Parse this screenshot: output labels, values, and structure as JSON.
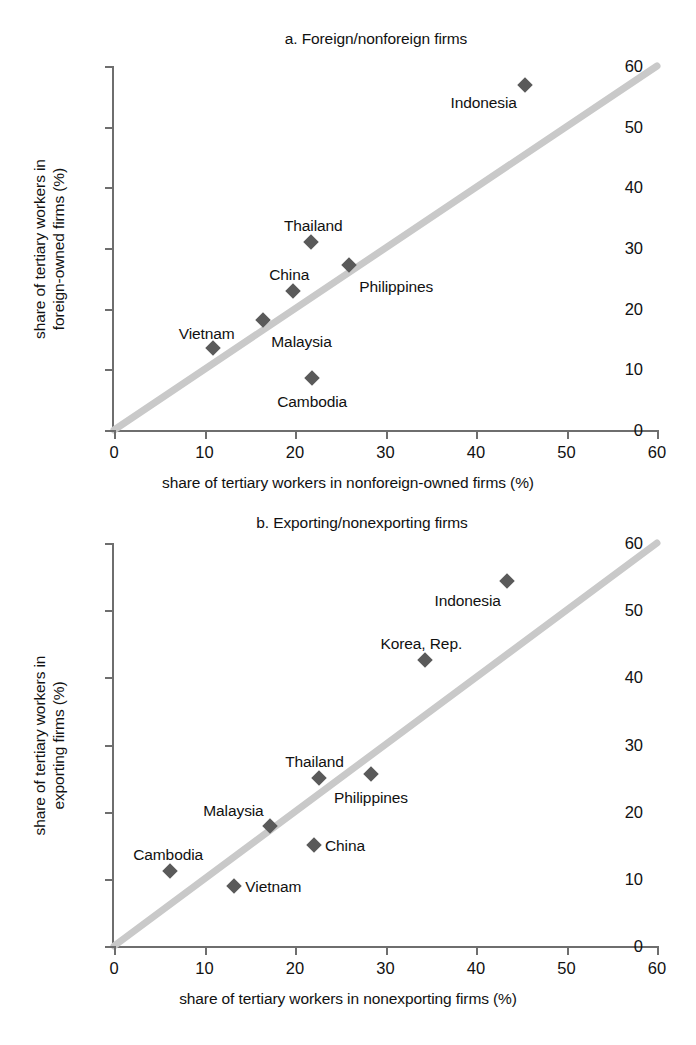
{
  "figure": {
    "background": "#ffffff",
    "marker_color": "#5a5a5a",
    "diagonal_color": "#c9c9c9",
    "axis_color": "#6e6e6e",
    "text_color": "#111111"
  },
  "chart_data": [
    {
      "type": "scatter",
      "title": "a. Foreign/nonforeign firms",
      "xlabel": "share of tertiary workers in nonforeign-owned firms (%)",
      "ylabel": "share of tertiary workers in\nforeign-owned firms (%)",
      "ylabel_line1": "share of tertiary workers in",
      "ylabel_line2": "foreign-owned firms (%)",
      "xlim": [
        0,
        60
      ],
      "ylim": [
        0,
        60
      ],
      "xticks": [
        0,
        10,
        20,
        30,
        40,
        50,
        60
      ],
      "yticks": [
        0,
        10,
        20,
        30,
        40,
        50,
        60
      ],
      "xticklabels": [
        "0",
        "10",
        "20",
        "30",
        "40",
        "50",
        "60"
      ],
      "yticklabels": [
        "0",
        "10",
        "20",
        "30",
        "40",
        "50",
        "60"
      ],
      "grid": false,
      "legend": "none",
      "reference_line": {
        "name": "45-degree line",
        "from": [
          0,
          0
        ],
        "to": [
          60,
          60
        ]
      },
      "points": [
        {
          "label": "Indonesia",
          "x": 45.4,
          "y": 56.8,
          "label_dx": -8,
          "label_dy": 18,
          "label_anchor": "end"
        },
        {
          "label": "Thailand",
          "x": 21.8,
          "y": 31.0,
          "label_dx": 2,
          "label_dy": -16,
          "label_anchor": "middle"
        },
        {
          "label": "Philippines",
          "x": 26.0,
          "y": 27.2,
          "label_dx": 10,
          "label_dy": 22,
          "label_anchor": "start"
        },
        {
          "label": "China",
          "x": 19.8,
          "y": 22.9,
          "label_dx": -4,
          "label_dy": -16,
          "label_anchor": "middle"
        },
        {
          "label": "Malaysia",
          "x": 16.5,
          "y": 18.1,
          "label_dx": 8,
          "label_dy": 22,
          "label_anchor": "start"
        },
        {
          "label": "Vietnam",
          "x": 10.9,
          "y": 13.5,
          "label_dx": -6,
          "label_dy": -14,
          "label_anchor": "middle"
        },
        {
          "label": "Cambodia",
          "x": 21.9,
          "y": 8.6,
          "label_dx": 0,
          "label_dy": 24,
          "label_anchor": "middle"
        }
      ]
    },
    {
      "type": "scatter",
      "title": "b. Exporting/nonexporting firms",
      "xlabel": "share of tertiary workers in nonexporting firms (%)",
      "ylabel": "share of tertiary workers in\nexporting firms (%)",
      "ylabel_line1": "share of tertiary workers in",
      "ylabel_line2": "exporting firms (%)",
      "xlim": [
        0,
        60
      ],
      "ylim": [
        0,
        60
      ],
      "xticks": [
        0,
        10,
        20,
        30,
        40,
        50,
        60
      ],
      "yticks": [
        0,
        10,
        20,
        30,
        40,
        50,
        60
      ],
      "xticklabels": [
        "0",
        "10",
        "20",
        "30",
        "40",
        "50",
        "60"
      ],
      "yticklabels": [
        "0",
        "10",
        "20",
        "30",
        "40",
        "50",
        "60"
      ],
      "grid": false,
      "legend": "none",
      "reference_line": {
        "name": "45-degree line",
        "from": [
          0,
          0
        ],
        "to": [
          60,
          60
        ]
      },
      "points": [
        {
          "label": "Indonesia",
          "x": 43.4,
          "y": 54.3,
          "label_dx": -6,
          "label_dy": 20,
          "label_anchor": "end"
        },
        {
          "label": "Korea, Rep.",
          "x": 34.4,
          "y": 42.6,
          "label_dx": -4,
          "label_dy": -16,
          "label_anchor": "middle"
        },
        {
          "label": "Philippines",
          "x": 28.4,
          "y": 25.6,
          "label_dx": 0,
          "label_dy": 24,
          "label_anchor": "middle"
        },
        {
          "label": "Thailand",
          "x": 22.6,
          "y": 25.0,
          "label_dx": -4,
          "label_dy": -16,
          "label_anchor": "middle"
        },
        {
          "label": "Malaysia",
          "x": 17.2,
          "y": 17.8,
          "label_dx": -6,
          "label_dy": -15,
          "label_anchor": "end"
        },
        {
          "label": "China",
          "x": 22.1,
          "y": 15.0,
          "label_dx": 11,
          "label_dy": 1,
          "label_anchor": "start"
        },
        {
          "label": "Cambodia",
          "x": 6.2,
          "y": 11.2,
          "label_dx": -2,
          "label_dy": -16,
          "label_anchor": "middle"
        },
        {
          "label": "Vietnam",
          "x": 13.3,
          "y": 8.9,
          "label_dx": 11,
          "label_dy": 1,
          "label_anchor": "start"
        }
      ]
    }
  ]
}
